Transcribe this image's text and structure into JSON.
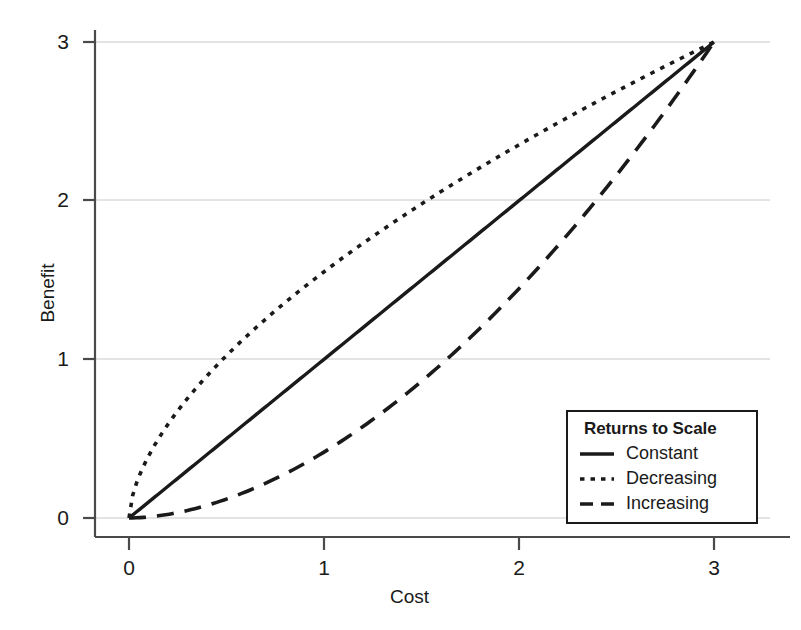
{
  "chart_data": {
    "type": "line",
    "title": "",
    "xlabel": "Cost",
    "ylabel": "Benefit",
    "xlim": [
      0,
      3
    ],
    "ylim": [
      0,
      3
    ],
    "xticks": [
      "0",
      "1",
      "2",
      "3"
    ],
    "yticks": [
      "0",
      "1",
      "2",
      "3"
    ],
    "xtick_values": [
      0,
      1,
      2,
      3
    ],
    "ytick_values": [
      0,
      1,
      2,
      3
    ],
    "grid": "horizontal",
    "legend_position": "bottom-right",
    "legend_title": "Returns to Scale",
    "x": [
      0,
      0.25,
      0.5,
      0.75,
      1,
      1.25,
      1.5,
      1.75,
      2,
      2.25,
      2.5,
      2.75,
      3
    ],
    "series": [
      {
        "name": "Constant",
        "style": "solid",
        "formula": "y = x",
        "values": [
          0,
          0.25,
          0.5,
          0.75,
          1,
          1.25,
          1.5,
          1.75,
          2,
          2.25,
          2.5,
          2.75,
          3
        ]
      },
      {
        "name": "Decreasing",
        "style": "dotted",
        "formula": "y = 3 * (x/3)^0.6",
        "values": [
          0,
          0.72,
          1.09,
          1.39,
          1.65,
          1.88,
          2.09,
          2.29,
          2.48,
          2.66,
          2.83,
          2.99,
          3
        ]
      },
      {
        "name": "Increasing",
        "style": "dashed",
        "formula": "y = 3 * (x/3)^1.8",
        "values": [
          0,
          0.04,
          0.14,
          0.29,
          0.49,
          0.72,
          0.99,
          1.29,
          1.62,
          1.99,
          2.38,
          2.81,
          3
        ]
      }
    ]
  },
  "axes": {
    "x_title": "Cost",
    "y_title": "Benefit",
    "x_tick_0": "0",
    "x_tick_1": "1",
    "x_tick_2": "2",
    "x_tick_3": "3",
    "y_tick_0": "0",
    "y_tick_1": "1",
    "y_tick_2": "2",
    "y_tick_3": "3"
  },
  "legend": {
    "title": "Returns to Scale",
    "items": [
      {
        "label": "Constant",
        "style": "solid"
      },
      {
        "label": "Decreasing",
        "style": "dotted"
      },
      {
        "label": "Increasing",
        "style": "dashed"
      }
    ]
  },
  "colors": {
    "line": "#1a1a1a",
    "grid": "#c8c8c8",
    "axis": "#4a4a4a",
    "background": "#ffffff"
  }
}
